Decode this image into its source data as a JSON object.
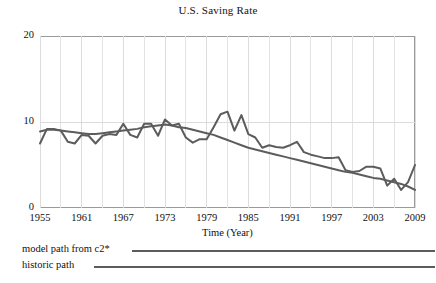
{
  "chart_data": {
    "type": "line",
    "title": "U.S. Saving Rate",
    "xlabel": "Time (Year)",
    "ylabel": "",
    "xlim": [
      1955,
      2009
    ],
    "ylim": [
      0,
      20
    ],
    "yticks": [
      0,
      10,
      20
    ],
    "ytick_labels": [
      "0",
      "10",
      "20"
    ],
    "xticks": [
      1955,
      1961,
      1967,
      1973,
      1979,
      1985,
      1991,
      1997,
      2003,
      2009
    ],
    "xtick_labels": [
      "1955",
      "1961",
      "1967",
      "1973",
      "1979",
      "1985",
      "1991",
      "1997",
      "2003",
      "2009"
    ],
    "grid": true,
    "legend_position": "below-plot",
    "line_color": "#5c5c5c",
    "series": [
      {
        "name": "model path from  c2*",
        "x": [
          1955,
          1956,
          1957,
          1958,
          1959,
          1960,
          1961,
          1962,
          1963,
          1964,
          1965,
          1966,
          1967,
          1968,
          1969,
          1970,
          1971,
          1972,
          1973,
          1974,
          1975,
          1976,
          1977,
          1978,
          1979,
          1980,
          1981,
          1982,
          1983,
          1984,
          1985,
          1986,
          1987,
          1988,
          1989,
          1990,
          1991,
          1992,
          1993,
          1994,
          1995,
          1996,
          1997,
          1998,
          1999,
          2000,
          2001,
          2002,
          2003,
          2004,
          2005,
          2006,
          2007,
          2008,
          2009
        ],
        "values": [
          8.9,
          9.1,
          9.1,
          9.0,
          8.9,
          8.8,
          8.7,
          8.6,
          8.6,
          8.7,
          8.8,
          8.9,
          9.0,
          9.1,
          9.2,
          9.4,
          9.5,
          9.6,
          9.7,
          9.6,
          9.4,
          9.3,
          9.1,
          8.9,
          8.7,
          8.5,
          8.2,
          7.9,
          7.6,
          7.3,
          7.0,
          6.8,
          6.6,
          6.4,
          6.2,
          6.0,
          5.8,
          5.6,
          5.4,
          5.2,
          5.0,
          4.8,
          4.6,
          4.4,
          4.2,
          4.1,
          3.9,
          3.7,
          3.5,
          3.4,
          3.2,
          3.0,
          2.8,
          2.5,
          2.1
        ]
      },
      {
        "name": "historic path",
        "x": [
          1955,
          1956,
          1957,
          1958,
          1959,
          1960,
          1961,
          1962,
          1963,
          1964,
          1965,
          1966,
          1967,
          1968,
          1969,
          1970,
          1971,
          1972,
          1973,
          1974,
          1975,
          1976,
          1977,
          1978,
          1979,
          1980,
          1981,
          1982,
          1983,
          1984,
          1985,
          1986,
          1987,
          1988,
          1989,
          1990,
          1991,
          1992,
          1993,
          1994,
          1995,
          1996,
          1997,
          1998,
          1999,
          2000,
          2001,
          2002,
          2003,
          2004,
          2005,
          2006,
          2007,
          2008,
          2009
        ],
        "values": [
          7.5,
          9.2,
          9.2,
          9.0,
          7.7,
          7.5,
          8.5,
          8.4,
          7.5,
          8.4,
          8.6,
          8.5,
          9.8,
          8.5,
          8.2,
          9.8,
          9.8,
          8.4,
          10.3,
          9.6,
          9.8,
          8.2,
          7.6,
          8.0,
          8.0,
          9.4,
          10.9,
          11.2,
          9.0,
          10.8,
          8.6,
          8.2,
          7.0,
          7.3,
          7.1,
          7.0,
          7.3,
          7.7,
          6.5,
          6.2,
          6.0,
          5.8,
          5.8,
          5.9,
          4.4,
          4.2,
          4.3,
          4.8,
          4.8,
          4.6,
          2.6,
          3.4,
          2.1,
          3.0,
          5.0
        ]
      }
    ]
  },
  "axes": {
    "title": "U.S. Saving Rate",
    "xaxis_title": "Time (Year)"
  },
  "legend": {
    "items": [
      {
        "label": "model path from  c2*"
      },
      {
        "label": "historic path"
      }
    ]
  }
}
